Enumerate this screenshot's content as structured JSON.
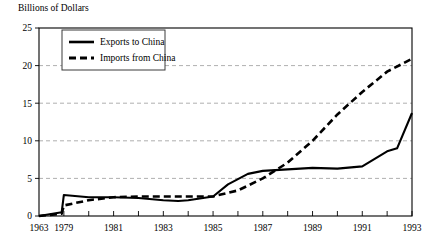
{
  "chart_data": {
    "type": "line",
    "title": "Billions of Dollars",
    "xlabel": "",
    "ylabel": "Billions of Dollars",
    "ylim": [
      0,
      25
    ],
    "yticks": [
      0,
      5,
      10,
      15,
      20,
      25
    ],
    "ytick_labels": [
      "0",
      "5",
      "10",
      "15",
      "20",
      "25"
    ],
    "grid": "horizontal",
    "legend_position": "top-left-inside",
    "x_axis_note": "axis break between 1963 and 1979",
    "x": [
      1963,
      1979,
      1980,
      1981,
      1982,
      1983,
      1984,
      1985,
      1986,
      1987,
      1988,
      1989,
      1990,
      1991,
      1992,
      1993
    ],
    "xtick_labels": [
      "1963",
      "1979",
      "",
      "1981",
      "",
      "1983",
      "",
      "1985",
      "",
      "1987",
      "",
      "1989",
      "",
      "1991",
      "",
      "1993"
    ],
    "xticks_labeled": [
      "1963",
      "1979",
      "1981",
      "1983",
      "1985",
      "1987",
      "1989",
      "1991",
      "1993"
    ],
    "series": [
      {
        "name": "Exports to China",
        "style": "solid",
        "values": [
          0.05,
          1.7,
          3.1,
          3.6,
          2.9,
          2.2,
          3.0,
          3.9,
          3.1,
          3.5,
          5.0,
          5.8,
          4.8,
          6.3,
          7.5,
          8.8
        ]
      },
      {
        "name": "Imports from China",
        "style": "dashed",
        "values": [
          0.0,
          0.6,
          1.1,
          1.9,
          2.3,
          2.2,
          3.1,
          3.9,
          4.8,
          6.3,
          8.5,
          12.0,
          15.2,
          19.0,
          25.7,
          31.5
        ]
      }
    ],
    "series_plot": [
      {
        "name": "Exports to China",
        "style": "solid",
        "points": [
          [
            1963,
            0.0
          ],
          [
            1977.6,
            0.5
          ],
          [
            1979,
            2.8
          ],
          [
            1980,
            2.5
          ],
          [
            1981,
            2.5
          ],
          [
            1982,
            2.4
          ],
          [
            1983,
            2.1
          ],
          [
            1983.6,
            2.0
          ],
          [
            1984,
            2.1
          ],
          [
            1985,
            2.6
          ],
          [
            1985.6,
            4.2
          ],
          [
            1986.4,
            5.6
          ],
          [
            1987,
            6.0
          ],
          [
            1988,
            6.2
          ],
          [
            1989,
            6.4
          ],
          [
            1990,
            6.3
          ],
          [
            1991,
            6.6
          ],
          [
            1992,
            8.6
          ],
          [
            1992.4,
            9.0
          ],
          [
            1993,
            13.7
          ]
        ],
        "final_value": 13.7
      },
      {
        "name": "Imports from China",
        "style": "dashed",
        "points": [
          [
            1963,
            0.0
          ],
          [
            1977.6,
            0.3
          ],
          [
            1979,
            1.4
          ],
          [
            1980,
            2.1
          ],
          [
            1981,
            2.5
          ],
          [
            1982,
            2.6
          ],
          [
            1983,
            2.6
          ],
          [
            1984,
            2.6
          ],
          [
            1985,
            2.6
          ],
          [
            1986,
            3.4
          ],
          [
            1987,
            5.0
          ],
          [
            1988,
            7.1
          ],
          [
            1989,
            10.0
          ],
          [
            1990,
            13.5
          ],
          [
            1991,
            16.5
          ],
          [
            1992,
            19.2
          ],
          [
            1993,
            20.9
          ]
        ],
        "final_value": 20.9
      }
    ],
    "legend": [
      {
        "label": "Exports to China",
        "style": "solid"
      },
      {
        "label": "Imports from China",
        "style": "dashed"
      }
    ]
  },
  "layout": {
    "plot_left": 39,
    "plot_right": 412,
    "plot_top": 28,
    "plot_bottom": 216,
    "legend_x": 62,
    "legend_y": 30,
    "legend_w": 103,
    "legend_h": 40
  }
}
